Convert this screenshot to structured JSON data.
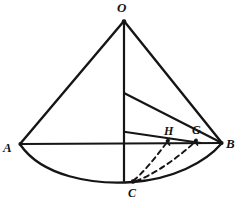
{
  "figure": {
    "kind": "geometric-diagram",
    "stroke_color": "#151515",
    "background_color": "#ffffff",
    "labels": {
      "apex": "O",
      "left_base": "A",
      "right_base": "B",
      "point_h": "H",
      "point_g": "G",
      "bottom_base": "C"
    },
    "geometry": {
      "apex_point": [
        124,
        21
      ],
      "left_base_point": [
        20,
        144
      ],
      "right_base_point": [
        222,
        143
      ],
      "bottom_base_point": [
        133,
        181
      ],
      "axis_foot_point": [
        124,
        181
      ],
      "inner_vertex_point": [
        124,
        93
      ],
      "chord_left_point": [
        124,
        132
      ],
      "chord_right_point": [
        201,
        143
      ],
      "point_h_marker": [
        168,
        140
      ],
      "point_g_marker": [
        196,
        140
      ],
      "base_arc_depth_px": 39,
      "dashed_curve_count": 2
    },
    "strokes": [
      {
        "name": "slant-OA",
        "type": "line",
        "from": [
          124,
          21
        ],
        "to": [
          20,
          144
        ]
      },
      {
        "name": "slant-OB",
        "type": "line",
        "from": [
          124,
          21
        ],
        "to": [
          222,
          143
        ]
      },
      {
        "name": "axis-OC",
        "type": "line",
        "from": [
          124,
          21
        ],
        "to": [
          124,
          181
        ]
      },
      {
        "name": "diameter-AB",
        "type": "line",
        "from": [
          20,
          144
        ],
        "to": [
          222,
          143
        ]
      },
      {
        "name": "inner-slant-to-B",
        "type": "line",
        "from": [
          124,
          93
        ],
        "to": [
          222,
          143
        ]
      },
      {
        "name": "inner-chord-to-G",
        "type": "line",
        "from": [
          124,
          132
        ],
        "to": [
          201,
          143
        ]
      },
      {
        "name": "base-arc-ACB",
        "type": "arc",
        "from": [
          20,
          144
        ],
        "via": [
          133,
          182
        ],
        "to": [
          222,
          143
        ]
      },
      {
        "name": "dashed-curve-C-to-H",
        "type": "dashed-arc",
        "from": [
          133,
          180
        ],
        "to": [
          168,
          141
        ]
      },
      {
        "name": "dashed-curve-C-to-G",
        "type": "dashed-arc",
        "from": [
          137,
          181
        ],
        "to": [
          196,
          141
        ]
      }
    ]
  }
}
